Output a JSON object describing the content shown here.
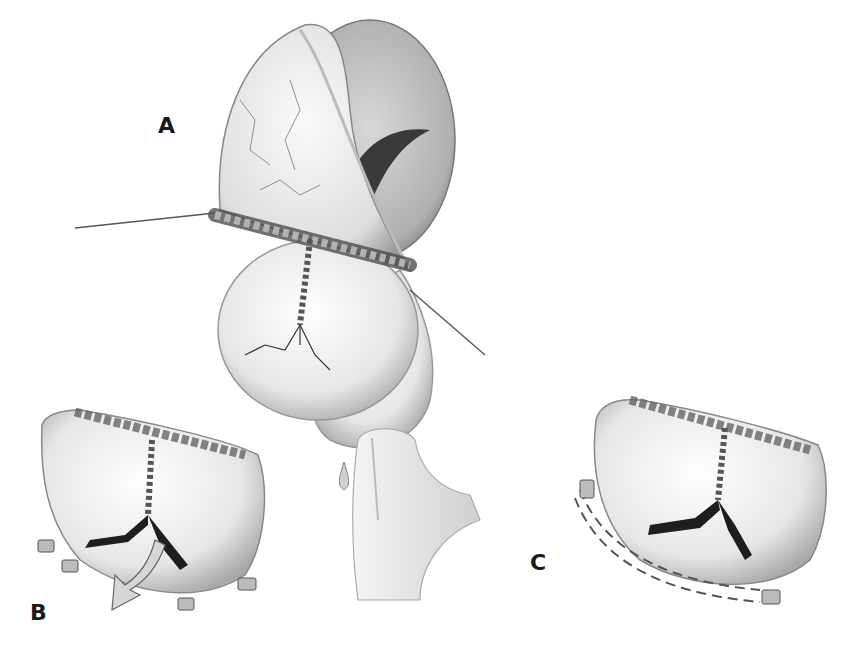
{
  "figure": {
    "panels": [
      {
        "id": "A",
        "label": "A",
        "description": "Opened heart/leaflet with transverse running suture line and vertical interrupted suture; needles passing through on both sides"
      },
      {
        "id": "B",
        "label": "B",
        "description": "Closed leaflet with Y-shaped opening, arrow indicating flow, pledgeted sutures along the lower margin"
      },
      {
        "id": "C",
        "label": "C",
        "description": "Closed leaflet with Y-shaped opening and dashed suture line with pledgets along lower margin"
      }
    ],
    "accessory": {
      "description": "Nozzle/tube instrument with droplet between panels B and C"
    }
  },
  "colors": {
    "ink": "#1a1a1a",
    "tissue_light": "#f1f1f1",
    "tissue_mid": "#cfcfcf",
    "tissue_dark": "#8a8a8a",
    "background": "#ffffff"
  }
}
